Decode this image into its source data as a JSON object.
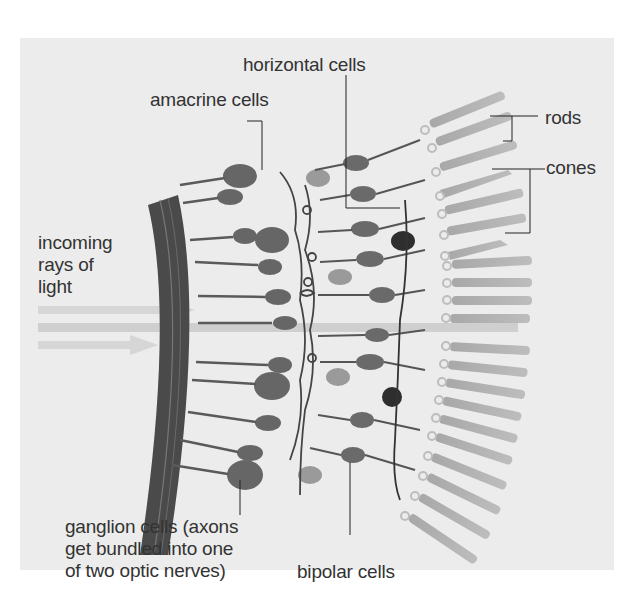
{
  "figure": {
    "labels": {
      "horizontal_cells": "horizontal cells",
      "amacrine_cells": "amacrine cells",
      "rods": "rods",
      "cones": "cones",
      "incoming_light": [
        "incoming",
        "rays of",
        "light"
      ],
      "ganglion_cells": [
        "ganglion cells (axons",
        "get bundled into one",
        "of two optic nerves)"
      ],
      "bipolar_cells": "bipolar cells"
    },
    "colors": {
      "panel_background": "#ececec",
      "optic_layer": "#4a4a4a",
      "cell_body": "#6a6a6a",
      "photoreceptor": "#b0b0b0",
      "light_rays": "#d6d6d6",
      "label_text": "#333333",
      "leader_lines": "#222222"
    }
  }
}
